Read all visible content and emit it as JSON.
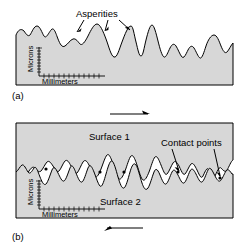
{
  "figure": {
    "title_none": "",
    "colors": {
      "surface_fill": "#d7d7d7",
      "outline": "#000000",
      "background": "#ffffff",
      "void_fill": "#ffffff"
    },
    "panels": [
      {
        "id": "a",
        "label": "(a)",
        "annotations": [
          {
            "name": "asperities",
            "text": "Asperities",
            "arrow_count": 3
          }
        ],
        "axes": {
          "y_label": "Microns",
          "x_label": "Millimeters",
          "y_ticks": 9,
          "x_ticks": 13
        }
      },
      {
        "id": "b",
        "label": "(b)",
        "annotations": [
          {
            "name": "contact-points",
            "text": "Contact points",
            "arrow_count": 2
          },
          {
            "name": "surface-1",
            "text": "Surface 1"
          },
          {
            "name": "surface-2",
            "text": "Surface 2"
          }
        ],
        "axes": {
          "y_label": "Microns",
          "x_label": "Millimeters",
          "y_ticks": 9,
          "x_ticks": 13
        },
        "motion": {
          "top_arrow_direction": "right",
          "bottom_arrow_direction": "left"
        }
      }
    ]
  }
}
